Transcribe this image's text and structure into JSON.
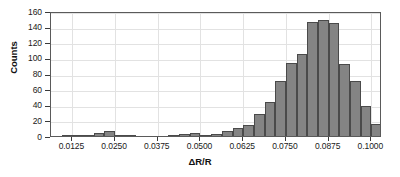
{
  "chart_data": {
    "type": "bar",
    "title": "",
    "xlabel": "ΔR/R",
    "ylabel": "Counts",
    "xlim": [
      0.00625,
      0.103125
    ],
    "ylim": [
      0,
      160
    ],
    "grid": true,
    "legend": "none",
    "bin_width": 0.003125,
    "x_ticks": [
      "0.0125",
      "0.0250",
      "0.0375",
      "0.0500",
      "0.0625",
      "0.0750",
      "0.0875",
      "0.1000"
    ],
    "x_tick_values": [
      0.0125,
      0.025,
      0.0375,
      0.05,
      0.0625,
      0.075,
      0.0875,
      0.1
    ],
    "y_ticks": [
      "0",
      "20",
      "40",
      "60",
      "80",
      "100",
      "120",
      "140",
      "160"
    ],
    "y_tick_values": [
      0,
      20,
      40,
      60,
      80,
      100,
      120,
      140,
      160
    ],
    "bin_centers": [
      0.0078125,
      0.0109375,
      0.0140625,
      0.0171875,
      0.0203125,
      0.0234375,
      0.0265625,
      0.0296875,
      0.0328125,
      0.0359375,
      0.0390625,
      0.0421875,
      0.0453125,
      0.0484375,
      0.0515625,
      0.0546875,
      0.0578125,
      0.0609375,
      0.0640625,
      0.0671875,
      0.0703125,
      0.0734375,
      0.0765625,
      0.0796875,
      0.0828125,
      0.0859375,
      0.0890625,
      0.0921875,
      0.0953125,
      0.0984375,
      0.1015625
    ],
    "values": [
      0,
      1,
      1,
      1,
      4,
      6,
      1,
      1,
      0,
      0,
      0,
      1,
      3,
      4,
      1,
      2,
      6,
      10,
      14,
      28,
      43,
      70,
      93,
      105,
      146,
      148,
      145,
      92,
      70,
      38,
      15
    ],
    "counts": [
      0,
      1,
      1,
      1,
      4,
      6,
      1,
      1,
      0,
      0,
      0,
      1,
      3,
      4,
      1,
      2,
      6,
      10,
      14,
      28,
      43,
      70,
      93,
      105,
      146,
      148,
      145,
      92,
      70,
      38,
      15
    ],
    "bar_color": "#848484",
    "bar_edge_color": "#4a4a4a",
    "grid_color": "#e2e2e2",
    "axis_color": "#5a5a5a"
  }
}
